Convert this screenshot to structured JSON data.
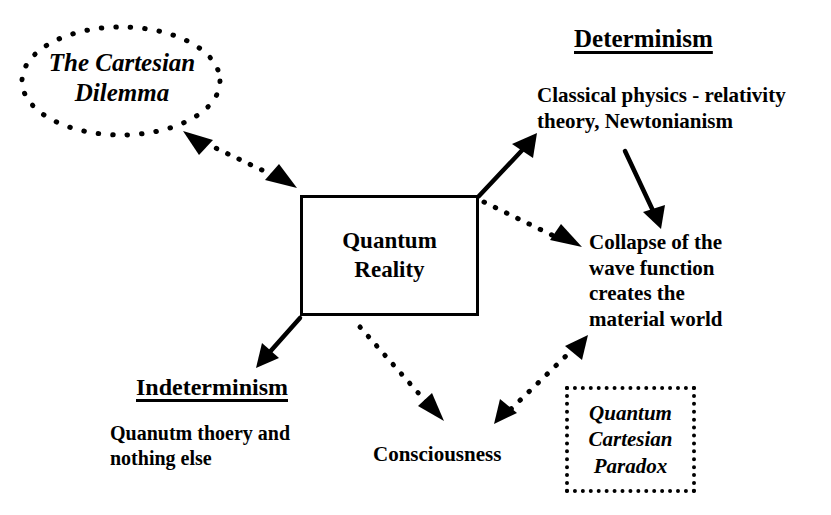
{
  "diagram": {
    "colors": {
      "stroke": "#000000",
      "background": "#ffffff"
    },
    "center": {
      "label": "Quantum\nReality",
      "shape": "rectangle",
      "border": "solid"
    },
    "nodes": [
      {
        "id": "cartesian-dilemma",
        "label": "The Cartesian\nDilemma",
        "shape": "ellipse",
        "border": "dotted",
        "style": "bold-italic"
      },
      {
        "id": "determinism",
        "heading": "Determinism",
        "heading_style": "bold-underline",
        "body": "Classical physics - relativity\ntheory, Newtonianism",
        "shape": "none"
      },
      {
        "id": "collapse-wave-function",
        "body": "Collapse of the\nwave function\ncreates the\nmaterial world",
        "shape": "none"
      },
      {
        "id": "indeterminism",
        "heading": "Indeterminism",
        "heading_style": "bold-underline",
        "body": "Quanutm thoery and\nnothing else",
        "shape": "none"
      },
      {
        "id": "consciousness",
        "label": "Consciousness",
        "shape": "none"
      },
      {
        "id": "quantum-cartesian-paradox",
        "label": "Quantum\nCartesian\nParadox",
        "shape": "rectangle",
        "border": "dotted",
        "style": "bold-italic"
      }
    ],
    "edges": [
      {
        "id": "edge-center-to-cartesian-dilemma",
        "from": "quantum-reality",
        "to": "cartesian-dilemma",
        "style": "dotted",
        "arrows": "both"
      },
      {
        "id": "edge-center-to-determinism",
        "from": "quantum-reality",
        "to": "determinism",
        "style": "solid",
        "arrows": "end"
      },
      {
        "id": "edge-determinism-to-collapse",
        "from": "determinism",
        "to": "collapse-wave-function",
        "style": "solid",
        "arrows": "end"
      },
      {
        "id": "edge-center-to-collapse",
        "from": "quantum-reality",
        "to": "collapse-wave-function",
        "style": "dotted",
        "arrows": "end"
      },
      {
        "id": "edge-center-to-indeterminism",
        "from": "quantum-reality",
        "to": "indeterminism",
        "style": "solid",
        "arrows": "end"
      },
      {
        "id": "edge-center-to-consciousness",
        "from": "quantum-reality",
        "to": "consciousness",
        "style": "dotted",
        "arrows": "end"
      },
      {
        "id": "edge-consciousness-to-collapse",
        "from": "consciousness",
        "to": "collapse-wave-function",
        "style": "dotted",
        "arrows": "both"
      }
    ]
  }
}
